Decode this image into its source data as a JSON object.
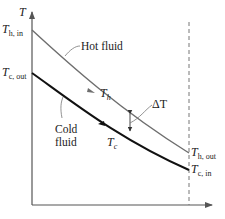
{
  "diagram": {
    "type": "temperature-profile",
    "y_axis": {
      "label": "T"
    },
    "x_axis": {
      "label": ""
    },
    "curves": {
      "hot": {
        "name": "Hot fluid",
        "symbol": "T",
        "subscript": "h",
        "color": "#6e6e6e",
        "start_label": {
          "symbol": "T",
          "subscript": "h, in"
        },
        "end_label": {
          "symbol": "T",
          "subscript": "h, out"
        }
      },
      "cold": {
        "name_line1": "Cold",
        "name_line2": "fluid",
        "symbol": "T",
        "subscript": "c",
        "color": "#111111",
        "start_label": {
          "symbol": "T",
          "subscript": "c, out"
        },
        "end_label": {
          "symbol": "T",
          "subscript": "c, in"
        }
      }
    },
    "delta_label": "ΔT",
    "colors": {
      "axis": "#555555",
      "dashed_line": "#777777",
      "leader": "#777777"
    }
  }
}
